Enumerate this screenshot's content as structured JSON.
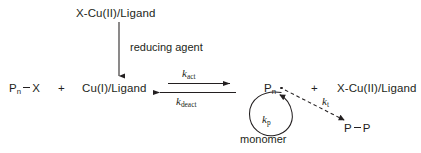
{
  "diagram": {
    "stroke_color": "#231f20",
    "background": "#ffffff",
    "species": {
      "oxidized_complex_top": "X-Cu(II)/Ligand",
      "dormant_chain_prefix": "P",
      "dormant_chain_sub": "n",
      "dormant_chain_suffix": "X",
      "reduced_complex": "Cu(I)/Ligand",
      "radical_prefix": "P",
      "radical_sub": "n",
      "oxidized_complex_right": "X-Cu(II)/Ligand",
      "dead_polymer_left": "P",
      "dead_polymer_right": "P"
    },
    "operators": {
      "plus_left": "+",
      "plus_right": "+"
    },
    "labels": {
      "reducing_agent": "reducing agent",
      "monomer": "monomer"
    },
    "rate_constants": {
      "activation": {
        "symbol": "k",
        "subscript": "act"
      },
      "deactivation": {
        "symbol": "k",
        "subscript": "deact"
      },
      "propagation": {
        "symbol": "k",
        "subscript": "p"
      },
      "termination": {
        "symbol": "k",
        "subscript": "t"
      }
    },
    "arrows": {
      "reduction_arrow": "vertical-down-arrow",
      "activation_arrow": "horizontal-right-arrow",
      "deactivation_arrow": "horizontal-left-arrow",
      "propagation_arrow": "circular-arrow",
      "termination_arrow": "dashed-diagonal-arrow"
    }
  }
}
